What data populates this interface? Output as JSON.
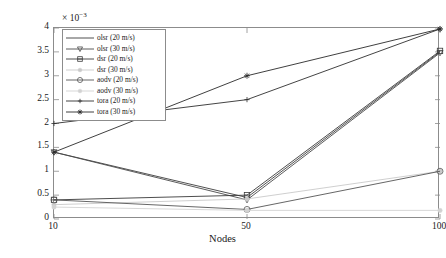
{
  "chart_data": {
    "type": "line",
    "title": "",
    "xlabel": "Nodes",
    "ylabel": "Delay (sec)",
    "y_multiplier": "× 10",
    "y_multiplier_exponent": "−3",
    "x_categories": [
      "10",
      "50",
      "100"
    ],
    "x_tick_labels": [
      "10",
      "50",
      "100"
    ],
    "y_tick_labels": [
      "0",
      "0.5",
      "1",
      "1.5",
      "2",
      "2.5",
      "3",
      "3.5",
      "4"
    ],
    "y_tick_values": [
      0,
      0.5,
      1,
      1.5,
      2,
      2.5,
      3,
      3.5,
      4
    ],
    "ylim": [
      0,
      4
    ],
    "grid": false,
    "legend_position": "upper-left",
    "units_note": "values in units of 1e-3 seconds",
    "series": [
      {
        "name": "olsr (20 m/s)",
        "marker": "none",
        "color": "#3d3d3d",
        "values": [
          1.4,
          0.45,
          3.5
        ]
      },
      {
        "name": "olsr (30 m/s)",
        "marker": "triangle-down",
        "color": "#4a4a4a",
        "values": [
          1.4,
          0.4,
          3.48
        ]
      },
      {
        "name": "dsr (20 m/s)",
        "marker": "square",
        "color": "#3a3a3a",
        "values": [
          0.4,
          0.5,
          3.52
        ]
      },
      {
        "name": "dsr (30 m/s)",
        "marker": "dot",
        "color": "#c9c9c9",
        "values": [
          0.3,
          0.42,
          1.0
        ]
      },
      {
        "name": "aodv (20 m/s)",
        "marker": "circle",
        "color": "#555555",
        "values": [
          0.4,
          0.2,
          1.0
        ]
      },
      {
        "name": "aodv (30 m/s)",
        "marker": "dot",
        "color": "#d2d2d2",
        "values": [
          0.25,
          0.18,
          0.18
        ]
      },
      {
        "name": "tora (20 m/s)",
        "marker": "plus",
        "color": "#2f2f2f",
        "values": [
          2.0,
          2.5,
          3.98
        ]
      },
      {
        "name": "tora (30 m/s)",
        "marker": "star",
        "color": "#2a2a2a",
        "values": [
          1.4,
          3.0,
          3.98
        ]
      }
    ]
  },
  "legend": {
    "items": [
      "olsr (20 m/s)",
      "olsr (30 m/s)",
      "dsr (20 m/s)",
      "dsr (30 m/s)",
      "aodv (20 m/s)",
      "aodv (30 m/s)",
      "tora (20 m/s)",
      "tora (30 m/s)"
    ]
  },
  "colors": {
    "axis": "#8c8c8c",
    "text": "#1a1a1a",
    "background": "#ffffff"
  }
}
